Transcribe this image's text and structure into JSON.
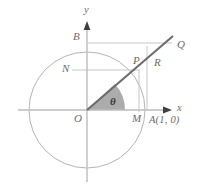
{
  "figure": {
    "colors": {
      "axis": "#b9b9b9",
      "circle": "#a9a9a9",
      "ray": "#6a6a6a",
      "helper_line": "#bfbfbf",
      "sector_fill": "#9e9e9e",
      "label": "#6b6b6b",
      "background": "#ffffff"
    },
    "axes": {
      "x_label": "x",
      "y_label": "y",
      "origin_label": "O"
    },
    "points": [
      {
        "name": "point-label-y-axis",
        "label": "y",
        "x": 84,
        "y": 6
      },
      {
        "name": "point-label-b",
        "label": "B",
        "x": 74,
        "y": 31
      },
      {
        "name": "point-label-q",
        "label": "Q",
        "x": 178,
        "y": 40
      },
      {
        "name": "point-label-p",
        "label": "P",
        "x": 134,
        "y": 56
      },
      {
        "name": "point-label-r",
        "label": "R",
        "x": 155,
        "y": 57
      },
      {
        "name": "point-label-n",
        "label": "N",
        "x": 64,
        "y": 64
      },
      {
        "name": "point-label-x-axis",
        "label": "x",
        "x": 177,
        "y": 104
      },
      {
        "name": "point-label-o",
        "label": "O",
        "x": 75,
        "y": 114
      },
      {
        "name": "point-label-m",
        "label": "M",
        "x": 134,
        "y": 114
      },
      {
        "name": "point-label-a",
        "label": "A(1, 0)",
        "x": 148,
        "y": 116
      },
      {
        "name": "point-label-theta",
        "label": "θ",
        "x": 110,
        "y": 97
      }
    ],
    "geometry": {
      "circle_center_x": 87,
      "circle_center_y": 110,
      "circle_radius": 58,
      "angle_degrees": 43,
      "unit_point_x": 146
    }
  }
}
